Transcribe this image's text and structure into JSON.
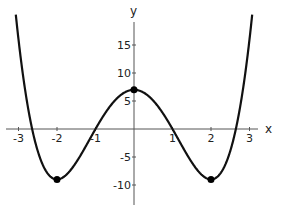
{
  "chart_data": {
    "type": "line",
    "title": "",
    "function": "x^4 - 8x^2 + 7",
    "xlabel": "x",
    "ylabel": "y",
    "xlim": [
      -3.4,
      3.2
    ],
    "ylim": [
      -14,
      20
    ],
    "grid": false,
    "legend": null,
    "x_ticks": [
      -3,
      -2,
      -1,
      1,
      2,
      3
    ],
    "x_tick_labels": [
      "-3",
      "-2",
      "-1",
      "1",
      "2",
      "3"
    ],
    "y_ticks": [
      -10,
      -5,
      5,
      10,
      15
    ],
    "y_tick_labels": [
      "-10",
      "-5",
      "5",
      "10",
      "15"
    ],
    "series": [
      {
        "name": "f(x)",
        "color": "#111111",
        "x": [
          -3.0,
          -2.75,
          -2.5,
          -2.25,
          -2.0,
          -1.75,
          -1.5,
          -1.25,
          -1.0,
          -0.75,
          -0.5,
          -0.25,
          0.0,
          0.25,
          0.5,
          0.75,
          1.0,
          1.25,
          1.5,
          1.75,
          2.0,
          2.25,
          2.5,
          2.75,
          3.0
        ],
        "y": [
          16,
          3.7,
          -4.94,
          -8.87,
          -9,
          -6.12,
          -5.94,
          -3.06,
          0,
          2.82,
          5.06,
          6.5,
          7,
          6.5,
          5.06,
          2.82,
          0,
          -3.06,
          -5.94,
          -6.12,
          -9,
          -8.87,
          -4.94,
          3.7,
          16
        ]
      }
    ],
    "points": [
      {
        "x": -2,
        "y": -9,
        "label": "local minimum"
      },
      {
        "x": 0,
        "y": 7,
        "label": "local maximum"
      },
      {
        "x": 2,
        "y": -9,
        "label": "local minimum"
      }
    ]
  }
}
